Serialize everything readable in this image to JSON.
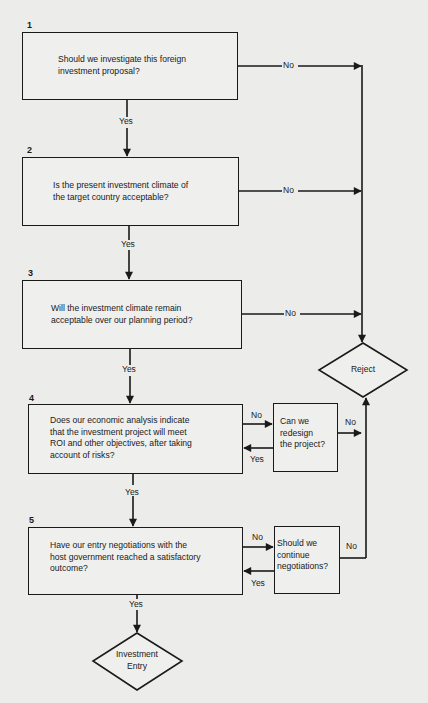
{
  "flowchart": {
    "steps": [
      {
        "number": "1",
        "question_lines": [
          "Should we investigate this foreign",
          "investment proposal?"
        ],
        "no_label": "No",
        "yes_label": "Yes"
      },
      {
        "number": "2",
        "question_lines": [
          "Is the present investment climate of",
          "the target country acceptable?"
        ],
        "no_label": "No",
        "yes_label": "Yes"
      },
      {
        "number": "3",
        "question_lines": [
          "Will the investment climate remain",
          "acceptable over our planning period?"
        ],
        "no_label": "No",
        "yes_label": "Yes"
      },
      {
        "number": "4",
        "question_lines": [
          "Does our economic analysis indicate",
          "that the investment project will meet",
          "ROI and other objectives, after taking",
          "account of risks?"
        ],
        "no_label": "No",
        "yes_label": "Yes",
        "side_question_lines": [
          "Can we",
          "redesign",
          "the project?"
        ],
        "side_no_label": "No",
        "side_yes_label": "Yes"
      },
      {
        "number": "5",
        "question_lines": [
          "Have our entry negotiations with the",
          "host government reached a satisfactory",
          "outcome?"
        ],
        "no_label": "No",
        "yes_label": "Yes",
        "side_question_lines": [
          "Should we",
          "continue",
          "negotiations?"
        ],
        "side_no_label": "No",
        "side_yes_label": "Yes"
      }
    ],
    "terminals": {
      "reject": "Reject",
      "entry_lines": [
        "Investment",
        "Entry"
      ]
    }
  },
  "colors": {
    "background": "#ececea",
    "ink": "#1a1a1a"
  }
}
